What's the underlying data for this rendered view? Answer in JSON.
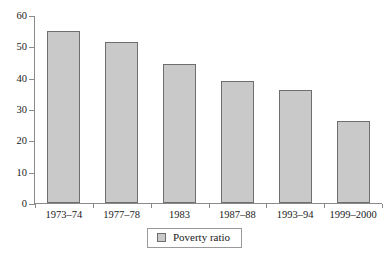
{
  "chart_data": {
    "type": "bar",
    "title": "",
    "subtitle": "",
    "xlabel": "",
    "ylabel": "",
    "categories": [
      "1973–74",
      "1977–78",
      "1983",
      "1987–88",
      "1993–94",
      "1999–2000"
    ],
    "series": [
      {
        "name": "Poverty ratio",
        "values": [
          54.9,
          51.3,
          44.5,
          38.9,
          36.0,
          26.1
        ]
      }
    ],
    "values": [
      54.9,
      51.3,
      44.5,
      38.9,
      36.0,
      26.1
    ],
    "ylim": [
      0,
      60
    ],
    "ytick_values": [
      0,
      10,
      20,
      30,
      40,
      50,
      60
    ],
    "ytick_labels": [
      "0",
      "10",
      "20",
      "30",
      "40",
      "50",
      "60"
    ],
    "grid": false,
    "legend": {
      "position": "bottom",
      "entries": [
        {
          "label": "Poverty ratio",
          "swatch_name": "legend-swatch-poverty-ratio"
        }
      ]
    },
    "colors": {
      "bar_fill": "#c9c9c9",
      "bar_border": "#6e6e6e",
      "axis": "#8a8a8a",
      "text": "#1a1a1a",
      "background": "#ffffff"
    }
  }
}
